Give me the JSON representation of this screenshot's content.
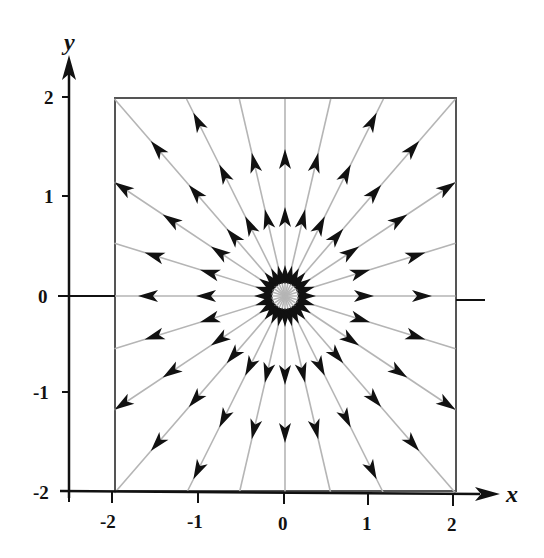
{
  "diagram": {
    "type": "phase-portrait / direction field",
    "axes": {
      "x_label": "x",
      "y_label": "y",
      "x_ticks": [
        "-2",
        "-1",
        "0",
        "1",
        "2"
      ],
      "y_ticks": [
        "2",
        "1",
        "0",
        "-1",
        "-2"
      ],
      "x_range": [
        -2,
        2
      ],
      "y_range": [
        -2,
        2
      ]
    },
    "box": {
      "x_min": -2,
      "x_max": 2,
      "y_min": -2,
      "y_max": 2
    },
    "rays": {
      "count": 24,
      "angle_step_deg": 15,
      "direction": "outward",
      "arrows_per_ray_approx": 3
    },
    "colors": {
      "axis": "#111111",
      "box": "#555555",
      "ray": "#b5b5b5",
      "arrow": "#111111",
      "background": "#ffffff"
    }
  }
}
